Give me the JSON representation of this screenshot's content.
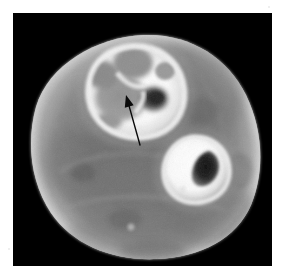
{
  "figure": {
    "kind": "medical-image",
    "modality": "CT",
    "plane": "axial",
    "body_region": "lower leg (tibia and fibula level)",
    "annotation_count": 1,
    "background_color": "#000000",
    "margin_color": "#ffffff",
    "frame": {
      "x": 13,
      "y": 13,
      "width": 259,
      "height": 253
    }
  },
  "image_content": {
    "limb_outline_label": "limb cross-section",
    "subcutaneous_fat_label": "subcutaneous fat rim",
    "muscle_label": "muscle compartment",
    "main_bone_label": "expanded bone with lytic lesions",
    "second_bone_label": "adjacent small bone",
    "marrow_label": "medullary cavity",
    "arrow_label": "pointer arrow"
  },
  "annotations": [
    {
      "name": "arrow",
      "type": "arrow",
      "color": "#0a0a0a",
      "tip_x": 126,
      "tip_y": 95,
      "tail_x": 140,
      "tail_y": 145,
      "points_to": "lucent lesion within bone"
    }
  ],
  "colors": {
    "background": "#000000",
    "margin": "#ffffff",
    "fat_rim": "#b9b9b9",
    "muscle": "#7c7c7c",
    "muscle_dark": "#686868",
    "bone_cortex": "#ffffff",
    "bone_bright": "#f6f6f6",
    "lesion_grey": "#9b9b9b",
    "lesion_dark": "#3a3a3a",
    "marrow_dark": "#151515",
    "arrow": "#0a0a0a"
  },
  "geometry": {
    "limb": {
      "center_x": 143,
      "center_y": 142,
      "radius_x": 121,
      "radius_y": 118
    },
    "main_bone": {
      "center_x": 122,
      "center_y": 78,
      "radius_x": 46,
      "radius_y": 43
    },
    "second_bone": {
      "center_x": 190,
      "center_y": 163,
      "radius_x": 28,
      "radius_y": 26
    }
  }
}
